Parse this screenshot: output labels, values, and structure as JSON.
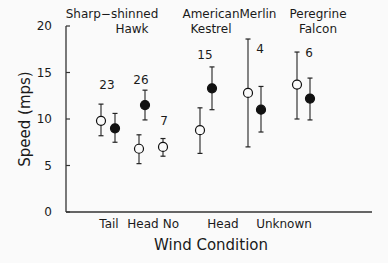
{
  "chart_data": {
    "type": "scatter",
    "title": "",
    "xlabel": "Wind Condition",
    "ylabel": "Speed (mps)",
    "ylim": [
      0,
      20
    ],
    "yticks": [
      0,
      5,
      10,
      15,
      20
    ],
    "grid": false,
    "groups": [
      {
        "label_line1": "Sharp−shinned",
        "label_line2": "Hawk"
      },
      {
        "label_line1": "American",
        "label_line2": "Kestrel"
      },
      {
        "label_line1": "Merlin",
        "label_line2": ""
      },
      {
        "label_line1": "Peregrine",
        "label_line2": "Falcon"
      }
    ],
    "xtick_labels": [
      "Tail",
      "Head",
      "No",
      "Head",
      "Unknown"
    ],
    "sample_sizes": [
      "23",
      "26",
      "7",
      "15",
      "4",
      "6"
    ],
    "points": [
      {
        "condition": "Tail",
        "marker": "open",
        "mean": 9.8,
        "lo": 8.2,
        "hi": 11.6
      },
      {
        "condition": "Tail",
        "marker": "filled",
        "mean": 9.0,
        "lo": 7.5,
        "hi": 10.6
      },
      {
        "condition": "Head",
        "marker": "open",
        "mean": 6.8,
        "lo": 5.2,
        "hi": 8.3
      },
      {
        "condition": "Head",
        "marker": "filled",
        "mean": 11.5,
        "lo": 9.9,
        "hi": 13.1
      },
      {
        "condition": "No",
        "marker": "open",
        "mean": 7.0,
        "lo": 6.0,
        "hi": 7.9
      },
      {
        "condition": "Head (American Kestrel)",
        "marker": "open",
        "mean": 8.8,
        "lo": 6.3,
        "hi": 11.2
      },
      {
        "condition": "Head (American Kestrel)",
        "marker": "filled",
        "mean": 13.3,
        "lo": 11.0,
        "hi": 15.6
      },
      {
        "condition": "Unknown (Merlin)",
        "marker": "open",
        "mean": 12.8,
        "lo": 7.0,
        "hi": 18.6
      },
      {
        "condition": "Unknown (Merlin)",
        "marker": "filled",
        "mean": 11.0,
        "lo": 8.6,
        "hi": 13.5
      },
      {
        "condition": "Unknown (Peregrine Falcon)",
        "marker": "open",
        "mean": 13.7,
        "lo": 10.0,
        "hi": 17.2
      },
      {
        "condition": "Unknown (Peregrine Falcon)",
        "marker": "filled",
        "mean": 12.2,
        "lo": 9.9,
        "hi": 14.4
      }
    ]
  }
}
